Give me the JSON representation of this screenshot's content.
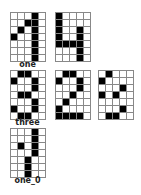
{
  "grid": {
    "cols": 5,
    "rows": 7
  },
  "colors": {
    "on": "#000000",
    "off": "#ffffff",
    "line": "#888888"
  },
  "samples": [
    {
      "label": "one",
      "x": 10,
      "y": 12,
      "cells": [
        [
          0,
          0,
          0,
          1,
          0
        ],
        [
          0,
          0,
          1,
          1,
          0
        ],
        [
          0,
          1,
          0,
          1,
          0
        ],
        [
          1,
          0,
          0,
          1,
          0
        ],
        [
          0,
          0,
          0,
          1,
          0
        ],
        [
          0,
          0,
          0,
          1,
          0
        ],
        [
          0,
          0,
          0,
          1,
          0
        ]
      ]
    },
    {
      "label": "",
      "x": 55,
      "y": 12,
      "cells": [
        [
          1,
          0,
          0,
          0,
          0
        ],
        [
          1,
          0,
          0,
          0,
          0
        ],
        [
          1,
          0,
          0,
          1,
          0
        ],
        [
          1,
          0,
          0,
          1,
          0
        ],
        [
          1,
          1,
          1,
          1,
          0
        ],
        [
          0,
          0,
          0,
          1,
          0
        ],
        [
          0,
          0,
          0,
          1,
          0
        ]
      ]
    },
    {
      "label": "three",
      "x": 10,
      "y": 70,
      "cells": [
        [
          0,
          1,
          1,
          0,
          0
        ],
        [
          1,
          0,
          0,
          1,
          0
        ],
        [
          0,
          0,
          0,
          1,
          0
        ],
        [
          0,
          1,
          1,
          0,
          0
        ],
        [
          0,
          0,
          0,
          1,
          0
        ],
        [
          1,
          0,
          0,
          1,
          0
        ],
        [
          0,
          1,
          1,
          0,
          0
        ]
      ]
    },
    {
      "label": "",
      "x": 55,
      "y": 70,
      "cells": [
        [
          0,
          1,
          1,
          0,
          0
        ],
        [
          1,
          0,
          0,
          1,
          0
        ],
        [
          0,
          0,
          0,
          1,
          0
        ],
        [
          0,
          0,
          1,
          0,
          0
        ],
        [
          0,
          1,
          0,
          0,
          0
        ],
        [
          1,
          0,
          0,
          0,
          0
        ],
        [
          1,
          1,
          1,
          1,
          0
        ]
      ]
    },
    {
      "label": "",
      "x": 98,
      "y": 70,
      "cells": [
        [
          0,
          1,
          0,
          0,
          0
        ],
        [
          1,
          0,
          0,
          0,
          0
        ],
        [
          0,
          0,
          0,
          1,
          0
        ],
        [
          1,
          0,
          1,
          0,
          0
        ],
        [
          0,
          0,
          0,
          0,
          0
        ],
        [
          0,
          0,
          0,
          1,
          0
        ],
        [
          0,
          1,
          1,
          0,
          0
        ]
      ]
    },
    {
      "label": "one_0",
      "x": 10,
      "y": 128,
      "cells": [
        [
          0,
          0,
          0,
          1,
          0
        ],
        [
          0,
          0,
          0,
          1,
          0
        ],
        [
          0,
          1,
          0,
          1,
          0
        ],
        [
          0,
          0,
          0,
          1,
          0
        ],
        [
          0,
          0,
          1,
          0,
          0
        ],
        [
          0,
          0,
          1,
          0,
          0
        ],
        [
          0,
          0,
          1,
          0,
          0
        ]
      ]
    }
  ]
}
